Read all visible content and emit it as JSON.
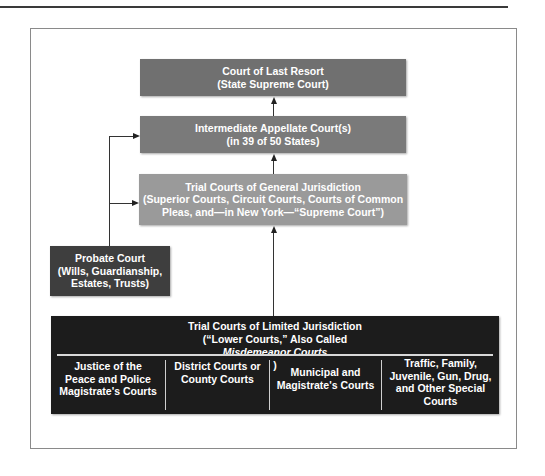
{
  "diagram": {
    "type": "hierarchy-flowchart",
    "nodes": {
      "last_resort": {
        "line1": "Court of Last Resort",
        "line2": "(State Supreme Court)"
      },
      "intermediate": {
        "line1": "Intermediate Appellate Court(s)",
        "line2": "(in 39 of 50 States)"
      },
      "general": {
        "line1": "Trial Courts of General Jurisdiction",
        "line2": "(Superior Courts, Circuit Courts, Courts of Common",
        "line3": "Pleas, and—in New York—“Supreme Court”)"
      },
      "probate": {
        "line1": "Probate Court",
        "line2": "(Wills, Guardianship,",
        "line3": "Estates, Trusts)"
      },
      "limited": {
        "line1": "Trial Courts of Limited Jurisdiction",
        "line2_prefix": "(“Lower Courts,” Also Called ",
        "line2_italic": "Misdemeanor Courts",
        "line2_suffix": ")",
        "columns": [
          {
            "lines": [
              "Justice of the",
              "Peace and Police",
              "Magistrate's Courts"
            ]
          },
          {
            "lines": [
              "District Courts or",
              "County Courts"
            ]
          },
          {
            "lines": [
              "Municipal and",
              "Magistrate's Courts"
            ]
          },
          {
            "lines": [
              "Traffic, Family,",
              "Juvenile, Gun, Drug,",
              "and Other Special",
              "Courts"
            ]
          }
        ]
      }
    },
    "edges": [
      {
        "from": "intermediate",
        "to": "last_resort"
      },
      {
        "from": "general",
        "to": "intermediate"
      },
      {
        "from": "limited",
        "to": "general"
      },
      {
        "from": "probate",
        "to": "intermediate"
      },
      {
        "from": "probate",
        "to": "general"
      }
    ],
    "colors": {
      "last_resort": "#707070",
      "intermediate": "#7a7a7a",
      "general": "#9a9a9a",
      "probate": "#3e3e3e",
      "limited": "#1c1c1c"
    }
  }
}
